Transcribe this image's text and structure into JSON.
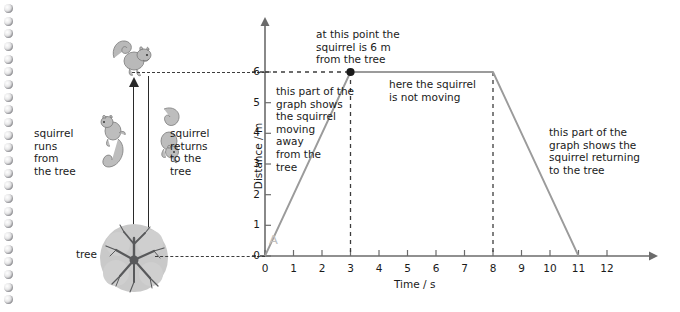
{
  "page": {
    "binding_hole_count": 24,
    "binding_color": "#b9b9bc"
  },
  "illustration": {
    "labels": {
      "runs_from_tree": "squirrel\nruns\nfrom\nthe tree",
      "returns_to_tree": "squirrel\nreturns\nto the\ntree",
      "tree": "tree"
    },
    "icons": {
      "squirrel_top": "squirrel-icon",
      "squirrel_running_away": "squirrel-icon",
      "squirrel_returning": "squirrel-icon",
      "tree": "tree-icon",
      "arrow_up": "arrow-up-icon",
      "arrow_down": "arrow-down-icon"
    }
  },
  "graph": {
    "annotations": {
      "at_point": "at this point the\nsquirrel is 6 m\nfrom the tree",
      "moving_away": "this part of the\ngraph shows\nthe squirrel\nmoving\naway\nfrom the\ntree",
      "not_moving": "here the squirrel\nis not moving",
      "returning": "this part of the\ngraph shows the\nsquirrel returning\nto the tree"
    },
    "point_marker_label": "A",
    "colors": {
      "line": "#9b9b9b",
      "axis": "#6b6b6b",
      "dashed": "#3d3d3d",
      "marker": "#1a1a1a",
      "marker_label": "#c0c0c0"
    }
  },
  "chart_data": {
    "type": "line",
    "title": "",
    "xlabel": "Time / s",
    "ylabel": "Distance / m",
    "xlim": [
      0,
      12.6
    ],
    "ylim": [
      0,
      6.6
    ],
    "xticks": [
      0,
      1,
      2,
      3,
      4,
      5,
      6,
      7,
      8,
      9,
      10,
      11,
      12
    ],
    "yticks": [
      0,
      1,
      2,
      3,
      4,
      5,
      6
    ],
    "grid": false,
    "legend": "none",
    "series": [
      {
        "name": "squirrel distance from tree",
        "x": [
          0,
          3,
          8,
          11
        ],
        "y": [
          0,
          6,
          6,
          0
        ]
      }
    ],
    "points": [
      {
        "label": "at this point the squirrel is 6 m from the tree",
        "x": 3,
        "y": 6
      }
    ],
    "guides": [
      {
        "type": "horizontal-dashed",
        "y": 6,
        "from_x": 0,
        "to_x": 3
      },
      {
        "type": "vertical-dashed",
        "x": 3,
        "from_y": 0,
        "to_y": 6
      },
      {
        "type": "vertical-dashed",
        "x": 8,
        "from_y": 0,
        "to_y": 6
      }
    ],
    "segments": [
      {
        "from": [
          0,
          0
        ],
        "to": [
          3,
          6
        ],
        "description": "squirrel moving away from the tree"
      },
      {
        "from": [
          3,
          6
        ],
        "to": [
          8,
          6
        ],
        "description": "squirrel is not moving"
      },
      {
        "from": [
          8,
          6
        ],
        "to": [
          11,
          0
        ],
        "description": "squirrel returning to the tree"
      }
    ]
  }
}
